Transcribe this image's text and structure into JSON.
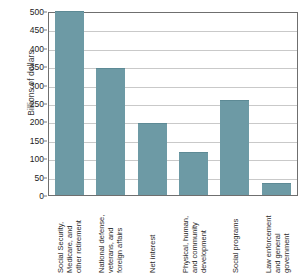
{
  "chart_data": {
    "type": "bar",
    "title": "",
    "xlabel": "",
    "ylabel": "Billions of dollars",
    "ylim": [
      0,
      500
    ],
    "ytick_step": 50,
    "grid": true,
    "legend": "none",
    "bar_color": "#6d9aa5",
    "categories": [
      "Social Security, Medicare, and other retirement",
      "National defense, veterans, and foreign affairs",
      "Net interest",
      "Physical, human, and community development",
      "Social programs",
      "Law enforcement and general government"
    ],
    "category_label_lines": [
      [
        "Social Security,",
        "Medicare, and",
        "other retirement"
      ],
      [
        "National defense,",
        "veterans, and",
        "foreign affairs"
      ],
      [
        "Net interest"
      ],
      [
        "Physical, human,",
        "and community",
        "development"
      ],
      [
        "Social programs"
      ],
      [
        "Law enforcement",
        "and general",
        "government"
      ]
    ],
    "values": [
      500,
      345,
      197,
      116,
      257,
      32
    ],
    "yticks": [
      0,
      50,
      100,
      150,
      200,
      250,
      300,
      350,
      400,
      450,
      500
    ],
    "ytick_labels": [
      "0",
      "50",
      "100",
      "150",
      "200",
      "250",
      "300",
      "350",
      "400",
      "450",
      "500"
    ]
  }
}
